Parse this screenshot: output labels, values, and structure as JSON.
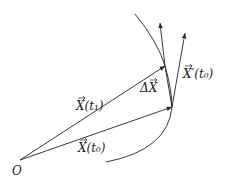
{
  "diagram": {
    "labels": {
      "origin": "O",
      "x_t0": "X(t₀)",
      "x_t1": "X(t₁)",
      "delta_x": "ΔX",
      "x_prime_t0": "X′(t₀)"
    },
    "points": {
      "origin": [
        20,
        160
      ],
      "x_t0": [
        172,
        107
      ],
      "x_t1": [
        165,
        66
      ],
      "tangent_tip": [
        185,
        33
      ],
      "secant_tip": [
        160,
        23
      ]
    },
    "colors": {
      "stroke": "#222222",
      "background": "#ffffff"
    }
  }
}
